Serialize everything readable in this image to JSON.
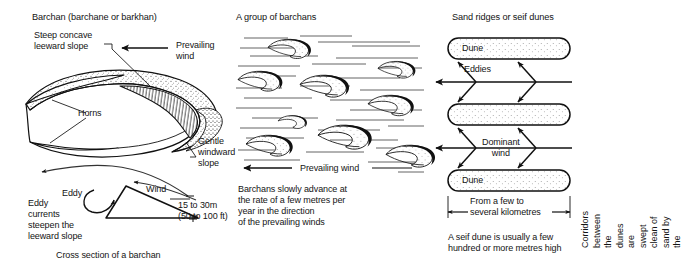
{
  "figure": {
    "background_color": "#ffffff",
    "ink_color": "#111111"
  },
  "columns": {
    "barchan": {
      "heading": "Barchan (barchane or barkhan)",
      "labels": {
        "leeward": "Steep concave\nleeward slope",
        "prevailing_wind": "Prevailing\nwind",
        "horns": "Horns",
        "windward": "Gentle\nwindward\nslope"
      },
      "cross_section": {
        "wind": "Wind",
        "eddy": "Eddy",
        "eddy_currents": "Eddy\ncurrents\nsteepen the\nleeward slope",
        "height_metric": "15 to 30m",
        "height_imperial": "(50 to 100 ft)",
        "caption": "Cross section of a barchan"
      }
    },
    "group": {
      "heading": "A group of barchans",
      "wind_label": "Prevailing wind",
      "caption": "Barchans slowly advance at\nthe rate of a few metres per\nyear in the direction\nof the prevailing winds"
    },
    "seif": {
      "heading": "Sand ridges or seif dunes",
      "dune_top_label": "Dune",
      "dune_bottom_label": "Dune",
      "eddies_label": "Eddies",
      "dominant_wind": "Dominant\nwind",
      "scale_label": "From a few to\nseveral kilometres",
      "caption": "A seif dune is usually a few\nhundred or more metres high",
      "side_note": "Corridors between\nthe dunes are swept\nclean of sand by the"
    }
  }
}
